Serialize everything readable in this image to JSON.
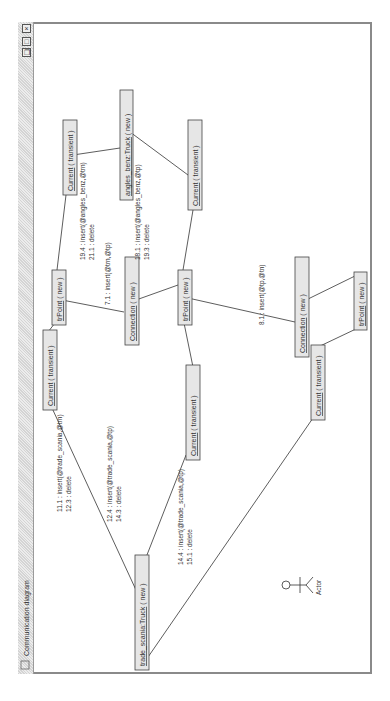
{
  "window": {
    "title": "Communication diagram",
    "controls": [
      {
        "name": "close-button",
        "glyph": "×"
      },
      {
        "name": "maximize-button",
        "glyph": "□"
      },
      {
        "name": "restore-button",
        "glyph": "❐"
      }
    ]
  },
  "orientation": "rotated 90deg counterclockwise",
  "nodes": [
    {
      "id": "trade_scania",
      "label": "trade_scania:Truck",
      "suffix": " ( new )",
      "underline": true
    },
    {
      "id": "angles_benz",
      "label": "angles_benz:Truck",
      "suffix": " ( new )",
      "underline": true
    },
    {
      "id": "cur1",
      "label": "Current",
      "suffix": " ( transient )",
      "underline": true
    },
    {
      "id": "cur2",
      "label": "Current",
      "suffix": " ( transient )",
      "underline": true
    },
    {
      "id": "cur3",
      "label": "Current",
      "suffix": " ( transient )",
      "underline": true
    },
    {
      "id": "cur4",
      "label": "Current",
      "suffix": " ( transient )",
      "underline": true
    },
    {
      "id": "cur5",
      "label": "Current",
      "suffix": " ( transient )",
      "underline": true
    },
    {
      "id": "tp1",
      "label": "trPoint",
      "suffix": " ( new )",
      "underline": true
    },
    {
      "id": "tp2",
      "label": "trPoint",
      "suffix": " ( new )",
      "underline": true
    },
    {
      "id": "tp3",
      "label": "trPoint",
      "suffix": " ( new )",
      "underline": true
    },
    {
      "id": "con1",
      "label": "Connection",
      "suffix": " ( new )",
      "underline": true
    },
    {
      "id": "con2",
      "label": "Connection",
      "suffix": " ( new )",
      "underline": true
    }
  ],
  "actor": {
    "label": "Actor"
  },
  "messages": [
    {
      "id": "m1",
      "lines": [
        "11.1 : insert(@trade_scania,@trn)",
        "12.3 : delete"
      ]
    },
    {
      "id": "m2",
      "lines": [
        "12.4 : insert(@trade_scania,@tp)",
        "14.3 : delete"
      ]
    },
    {
      "id": "m3",
      "lines": [
        "14.4 : insert(@trade_scania,@tp)",
        "15.1 : delete"
      ]
    },
    {
      "id": "m4",
      "lines": [
        "19.4 : insert(@angles_benz,@trn)",
        "21.1 : delete"
      ]
    },
    {
      "id": "m5",
      "lines": [
        "7.1 : insert(@trn,@tp)"
      ]
    },
    {
      "id": "m6",
      "lines": [
        "18.1 : insert(@angles_benz,@tp)",
        "19.3 : delete"
      ]
    },
    {
      "id": "m7",
      "lines": [
        "8.1 : insert(@tp,@tn)"
      ]
    }
  ],
  "colors": {
    "line": "#333333",
    "node_fill": "#e6e6e6",
    "node_border": "#444444",
    "frame": "#8a8a8a"
  }
}
